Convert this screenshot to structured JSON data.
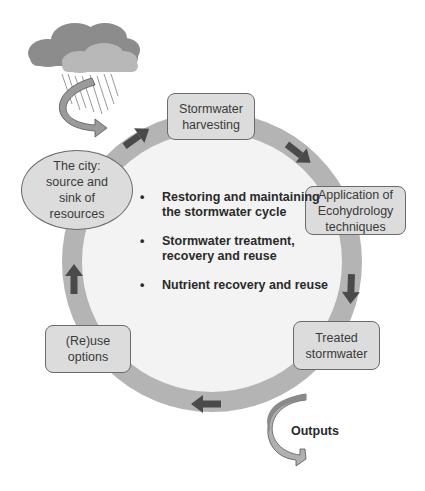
{
  "diagram": {
    "type": "cycle",
    "ring_color": "#b4b4b4",
    "inner_fill_color": "#f3f3f3",
    "arrow_color": "#4a4a4a",
    "box_fill_color": "#dcdcdc",
    "nodes": [
      {
        "id": "harvesting",
        "label_line1": "Stormwater",
        "label_line2": "harvesting"
      },
      {
        "id": "ecohydrology",
        "label_line1": "Application of",
        "label_line2": "Ecohydrology",
        "label_line3": "techniques"
      },
      {
        "id": "treated",
        "label_line1": "Treated",
        "label_line2": "stormwater"
      },
      {
        "id": "reuse",
        "label_line1": "(Re)use",
        "label_line2": "options"
      },
      {
        "id": "city",
        "label_line1": "The city:",
        "label_line2": "source and",
        "label_line3": "sink of",
        "label_line4": "resources"
      }
    ],
    "center_bullets": [
      {
        "bullet": "•",
        "text": "Restoring and maintaining the stormwater cycle"
      },
      {
        "bullet": "•",
        "text": "Stormwater treatment, recovery and reuse"
      },
      {
        "bullet": "•",
        "text": "Nutrient recovery and reuse"
      }
    ],
    "outputs_label": "Outputs",
    "icons": {
      "input": "rain-cloud-icon",
      "output": "curved-arrow-icon"
    }
  }
}
